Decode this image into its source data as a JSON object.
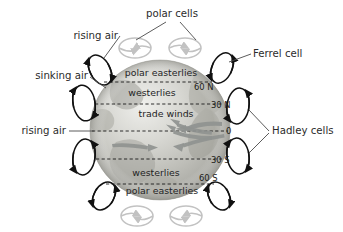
{
  "figure": {
    "background_color": "#ffffff",
    "text_color": "#2b2b2b"
  },
  "globe": {
    "name": "earth-globe",
    "center_x": 160,
    "center_y": 130,
    "radius": 70,
    "base_color": "#b9b9b4",
    "highlight_color": "#e6e6e2"
  },
  "outer_labels": [
    {
      "id": "polar-cells",
      "text": "polar cells",
      "x": 172,
      "y": 17,
      "anchor": "middle"
    },
    {
      "id": "rising-air-top",
      "text": "rising air",
      "x": 118,
      "y": 39,
      "anchor": "end"
    },
    {
      "id": "ferrel-cell",
      "text": "Ferrel cell",
      "x": 253,
      "y": 57,
      "anchor": "start"
    },
    {
      "id": "sinking-air",
      "text": "sinking air",
      "x": 88,
      "y": 79,
      "anchor": "end"
    },
    {
      "id": "rising-air-mid",
      "text": "rising air",
      "x": 66,
      "y": 134,
      "anchor": "end"
    },
    {
      "id": "hadley-cells",
      "text": "Hadley cells",
      "x": 272,
      "y": 134,
      "anchor": "start"
    }
  ],
  "wind_belt_labels": [
    {
      "id": "polar-easterlies-north",
      "text": "polar easterlies",
      "x": 161,
      "y": 76,
      "band": "north-polar"
    },
    {
      "id": "westerlies-north",
      "text": "westerlies",
      "x": 152,
      "y": 96,
      "band": "north-mid"
    },
    {
      "id": "trade-winds",
      "text": "trade winds",
      "x": 166,
      "y": 117,
      "band": "tropics"
    },
    {
      "id": "westerlies-south",
      "text": "westerlies",
      "x": 156,
      "y": 176,
      "band": "south-mid"
    },
    {
      "id": "polar-easterlies-south",
      "text": "polar easterlies",
      "x": 162,
      "y": 194,
      "band": "south-polar"
    }
  ],
  "latitude_labels": [
    {
      "id": "lat-60n",
      "text": "60 N",
      "x": 194,
      "y": 88,
      "line_y": 82,
      "line_x1": 104,
      "line_x2": 212
    },
    {
      "id": "lat-30n",
      "text": "30 N",
      "x": 213,
      "y": 107,
      "line_y": 104,
      "line_x1": 95,
      "line_x2": 222
    },
    {
      "id": "lat-0",
      "text": "0",
      "x": 224,
      "y": 134,
      "line_y": 131,
      "line_x1": 92,
      "line_x2": 228
    },
    {
      "id": "lat-30s",
      "text": "30 S",
      "x": 213,
      "y": 162,
      "line_y": 159,
      "line_x1": 96,
      "line_x2": 222
    },
    {
      "id": "lat-60s",
      "text": "60 S",
      "x": 201,
      "y": 180,
      "line_y": 184,
      "line_x1": 106,
      "line_x2": 214
    }
  ],
  "circulation_cells": [
    {
      "id": "polar-cell-top-left",
      "type": "polar",
      "shade": "light",
      "cx": 135,
      "cy": 48,
      "rx": 16,
      "ry": 10,
      "rot": 0,
      "spin": "cw"
    },
    {
      "id": "polar-cell-top-right",
      "type": "polar",
      "shade": "light",
      "cx": 185,
      "cy": 48,
      "rx": 16,
      "ry": 10,
      "rot": 0,
      "spin": "ccw"
    },
    {
      "id": "polar-cell-upper-left",
      "type": "polar",
      "shade": "dark",
      "cx": 100,
      "cy": 70,
      "rx": 10,
      "ry": 16,
      "rot": -28,
      "spin": "cw"
    },
    {
      "id": "ferrel-cell-upper-right",
      "type": "ferrel",
      "shade": "dark",
      "cx": 222,
      "cy": 68,
      "rx": 10,
      "ry": 16,
      "rot": 24,
      "spin": "ccw"
    },
    {
      "id": "ferrel-cell-left",
      "type": "ferrel",
      "shade": "dark",
      "cx": 84,
      "cy": 103,
      "rx": 11,
      "ry": 18,
      "rot": -10,
      "spin": "cw"
    },
    {
      "id": "hadley-cell-upper-right",
      "type": "hadley",
      "shade": "dark",
      "cx": 238,
      "cy": 106,
      "rx": 11,
      "ry": 18,
      "rot": 8,
      "spin": "ccw"
    },
    {
      "id": "hadley-cell-left",
      "type": "hadley",
      "shade": "dark",
      "cx": 84,
      "cy": 157,
      "rx": 11,
      "ry": 18,
      "rot": 8,
      "spin": "cw"
    },
    {
      "id": "hadley-cell-lower-right",
      "type": "hadley",
      "shade": "dark",
      "cx": 238,
      "cy": 156,
      "rx": 11,
      "ry": 18,
      "rot": -8,
      "spin": "ccw"
    },
    {
      "id": "ferrel-cell-lower-left",
      "type": "ferrel",
      "shade": "dark",
      "cx": 104,
      "cy": 196,
      "rx": 10,
      "ry": 15,
      "rot": 30,
      "spin": "cw"
    },
    {
      "id": "polar-cell-lower-right",
      "type": "polar",
      "shade": "dark",
      "cx": 219,
      "cy": 196,
      "rx": 10,
      "ry": 15,
      "rot": -28,
      "spin": "ccw"
    },
    {
      "id": "polar-cell-bottom-left",
      "type": "polar",
      "shade": "light",
      "cx": 137,
      "cy": 216,
      "rx": 16,
      "ry": 10,
      "rot": 0,
      "spin": "cw"
    },
    {
      "id": "polar-cell-bottom-right",
      "type": "polar",
      "shade": "light",
      "cx": 186,
      "cy": 216,
      "rx": 16,
      "ry": 10,
      "rot": 0,
      "spin": "ccw"
    }
  ],
  "trade_wind_arrows": [
    {
      "id": "trade-arrow-north-inner",
      "direction": "west"
    },
    {
      "id": "trade-arrow-north-outer",
      "direction": "west"
    },
    {
      "id": "trade-arrow-south-inner",
      "direction": "west"
    },
    {
      "id": "trade-arrow-south-outer",
      "direction": "west"
    }
  ],
  "leader_lines": [
    {
      "id": "leader-polar-cells-left",
      "from": "polar-cells",
      "to": "polar-cell-top-left"
    },
    {
      "id": "leader-polar-cells-right",
      "from": "polar-cells",
      "to": "polar-cell-top-right"
    },
    {
      "id": "leader-rising-air-top",
      "from": "rising-air-top",
      "to": "polar-cell-upper-left"
    },
    {
      "id": "leader-ferrel-cell",
      "from": "ferrel-cell",
      "to": "ferrel-cell-upper-right"
    },
    {
      "id": "leader-sinking-air",
      "from": "sinking-air",
      "to": "ferrel-cell-left"
    },
    {
      "id": "leader-rising-air-mid",
      "from": "rising-air-mid",
      "to": "hadley-cell-left"
    },
    {
      "id": "leader-hadley-upper",
      "from": "hadley-cells",
      "to": "hadley-cell-upper-right"
    },
    {
      "id": "leader-hadley-lower",
      "from": "hadley-cells",
      "to": "hadley-cell-lower-right"
    }
  ]
}
